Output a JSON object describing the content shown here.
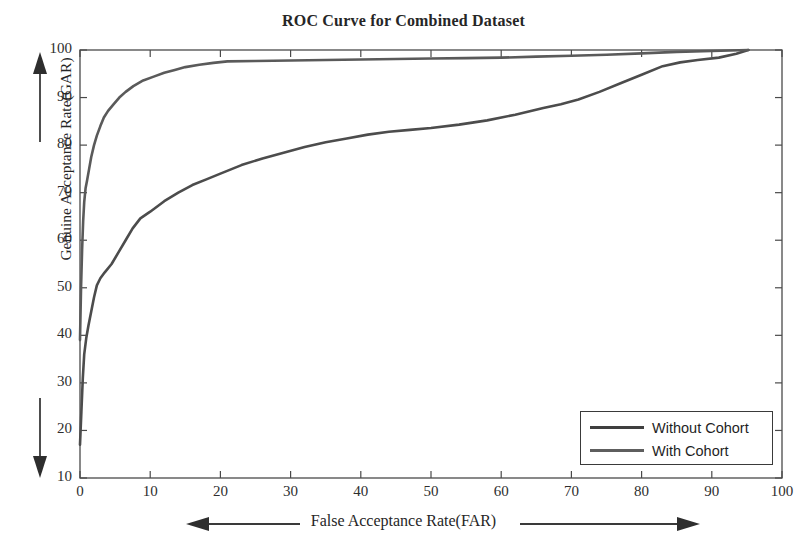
{
  "chart_data": {
    "type": "line",
    "title": "ROC Curve for Combined Dataset",
    "xlabel": "False Acceptance Rate(FAR)",
    "ylabel": "Genuine Acceptance Rate(GAR)",
    "xlim": [
      0,
      100
    ],
    "ylim": [
      10,
      100
    ],
    "xticks": [
      0,
      10,
      20,
      30,
      40,
      50,
      60,
      70,
      80,
      90,
      100
    ],
    "yticks": [
      10,
      20,
      30,
      40,
      50,
      60,
      70,
      80,
      90,
      100
    ],
    "grid": false,
    "legend_position": "lower right",
    "series": [
      {
        "name": "Without Cohort",
        "color": "#4c4c4c",
        "points": [
          [
            0.0,
            17.0
          ],
          [
            0.2,
            24.0
          ],
          [
            0.4,
            31.0
          ],
          [
            0.6,
            36.0
          ],
          [
            0.9,
            39.5
          ],
          [
            1.2,
            42.0
          ],
          [
            1.6,
            45.0
          ],
          [
            2.0,
            48.0
          ],
          [
            2.4,
            50.5
          ],
          [
            2.9,
            52.0
          ],
          [
            3.5,
            53.2
          ],
          [
            4.5,
            55.0
          ],
          [
            5.5,
            57.5
          ],
          [
            6.5,
            60.0
          ],
          [
            7.5,
            62.5
          ],
          [
            8.6,
            64.6
          ],
          [
            10.0,
            66.0
          ],
          [
            12.0,
            68.2
          ],
          [
            14.0,
            70.0
          ],
          [
            16.0,
            71.6
          ],
          [
            18.0,
            72.8
          ],
          [
            20.0,
            74.0
          ],
          [
            23.0,
            75.8
          ],
          [
            26.0,
            77.2
          ],
          [
            29.0,
            78.4
          ],
          [
            32.0,
            79.6
          ],
          [
            35.0,
            80.6
          ],
          [
            38.0,
            81.4
          ],
          [
            41.0,
            82.2
          ],
          [
            44.0,
            82.8
          ],
          [
            47.0,
            83.2
          ],
          [
            50.0,
            83.6
          ],
          [
            54.0,
            84.3
          ],
          [
            58.0,
            85.2
          ],
          [
            62.0,
            86.4
          ],
          [
            66.0,
            87.8
          ],
          [
            68.5,
            88.6
          ],
          [
            71.0,
            89.6
          ],
          [
            74.0,
            91.2
          ],
          [
            77.0,
            93.0
          ],
          [
            80.0,
            94.8
          ],
          [
            83.0,
            96.6
          ],
          [
            85.5,
            97.4
          ],
          [
            88.0,
            97.9
          ],
          [
            91.0,
            98.4
          ],
          [
            93.5,
            99.2
          ],
          [
            95.2,
            100.0
          ]
        ]
      },
      {
        "name": "With Cohort",
        "color": "#5a5a5a",
        "points": [
          [
            0.0,
            39.0
          ],
          [
            0.15,
            50.0
          ],
          [
            0.3,
            58.0
          ],
          [
            0.45,
            64.0
          ],
          [
            0.6,
            68.0
          ],
          [
            0.8,
            71.0
          ],
          [
            1.0,
            72.5
          ],
          [
            1.3,
            75.0
          ],
          [
            1.6,
            77.5
          ],
          [
            2.0,
            80.0
          ],
          [
            2.4,
            82.0
          ],
          [
            2.9,
            84.0
          ],
          [
            3.4,
            85.8
          ],
          [
            4.0,
            87.2
          ],
          [
            4.8,
            88.6
          ],
          [
            5.6,
            90.0
          ],
          [
            6.5,
            91.2
          ],
          [
            7.6,
            92.4
          ],
          [
            9.0,
            93.6
          ],
          [
            10.5,
            94.4
          ],
          [
            12.0,
            95.2
          ],
          [
            13.5,
            95.8
          ],
          [
            15.0,
            96.4
          ],
          [
            17.0,
            96.9
          ],
          [
            19.0,
            97.3
          ],
          [
            21.0,
            97.6
          ],
          [
            25.0,
            97.7
          ],
          [
            30.0,
            97.8
          ],
          [
            35.0,
            97.9
          ],
          [
            40.0,
            98.0
          ],
          [
            45.0,
            98.1
          ],
          [
            50.0,
            98.2
          ],
          [
            55.0,
            98.3
          ],
          [
            60.0,
            98.4
          ],
          [
            65.0,
            98.6
          ],
          [
            70.0,
            98.8
          ],
          [
            75.0,
            99.0
          ],
          [
            80.0,
            99.3
          ],
          [
            85.0,
            99.6
          ],
          [
            90.0,
            99.8
          ],
          [
            95.2,
            100.0
          ]
        ]
      }
    ],
    "axis_annotations": {
      "y_arrow_up": "↑",
      "y_arrow_down": "↓",
      "x_arrow_left": "←",
      "x_arrow_right": "→"
    }
  },
  "legend": {
    "items": [
      {
        "label": "Without Cohort",
        "color": "#3f3f3f"
      },
      {
        "label": "With Cohort",
        "color": "#5e5e5e"
      }
    ]
  },
  "style": {
    "axis_color": "#4a4a4a",
    "background": "#ffffff",
    "text_color": "#262626"
  }
}
